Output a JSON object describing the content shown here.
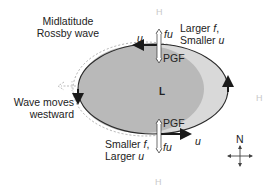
{
  "title_label": {
    "line1": "Midlatitude",
    "line2": "Rossby wave"
  },
  "top_note": {
    "line1_a": "Larger ",
    "line1_b": "f",
    "line1_c": ",",
    "line2_a": "Smaller ",
    "line2_b": "u"
  },
  "bottom_note": {
    "line1_a": "Smaller ",
    "line1_b": "f",
    "line1_c": ",",
    "line2_a": "Larger ",
    "line2_b": "u"
  },
  "motion_note": {
    "line1": "Wave moves",
    "line2": "westward"
  },
  "center_label": "L",
  "high_labels": [
    "H",
    "H",
    "H"
  ],
  "top_forces": {
    "coriolis": "fu",
    "pgf": "PGF",
    "wind": "u"
  },
  "bottom_forces": {
    "coriolis": "fu",
    "pgf": "PGF",
    "wind": "u"
  },
  "compass": {
    "north": "N"
  },
  "colors": {
    "outer_fill": "#d9d9d9",
    "inner_fill": "#b9b9b9",
    "outline": "#2a2a2a",
    "dotted": "#b0b0b0",
    "h_label": "#c8c8c8"
  }
}
